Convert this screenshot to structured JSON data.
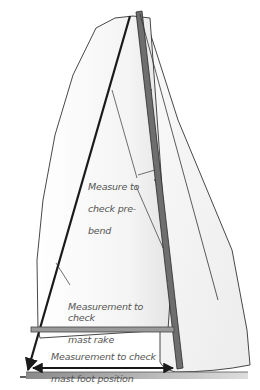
{
  "diagram": {
    "labels": {
      "prebend": "Measure to check pre-\nbend",
      "rake": "Measurement to check mast rake",
      "foot": "Measurement to check mast foot position"
    },
    "label_lines": {
      "prebend": [
        "Measure to",
        "check pre-",
        "bend"
      ],
      "rake": [
        "Measurement to check",
        "mast rake"
      ],
      "foot": [
        "Measurement to check",
        "mast foot position"
      ]
    },
    "colors": {
      "mast": "#6e6e6e",
      "lines": "#1a1a1a",
      "sail_outline": "#333333",
      "boom": "#9a9a9a",
      "deck": "#b5b5b5",
      "text": "#555555"
    }
  }
}
